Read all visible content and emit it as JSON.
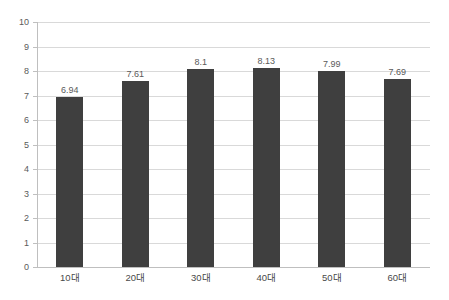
{
  "chart_data": {
    "type": "bar",
    "title": "",
    "subtitle": "",
    "xlabel": "",
    "ylabel": "",
    "categories": [
      "10대",
      "20대",
      "30대",
      "40대",
      "50대",
      "60대"
    ],
    "values": [
      6.94,
      7.61,
      8.1,
      8.13,
      7.99,
      7.69
    ],
    "value_labels": [
      "6.94",
      "7.61",
      "8.1",
      "8.13",
      "7.99",
      "7.69"
    ],
    "ylim": [
      0,
      10
    ],
    "ytick_values": [
      0,
      1,
      2,
      3,
      4,
      5,
      6,
      7,
      8,
      9,
      10
    ],
    "ytick_labels": [
      "0",
      "1",
      "2",
      "3",
      "4",
      "5",
      "6",
      "7",
      "8",
      "9",
      "10"
    ],
    "grid": true,
    "grid_axis": "y",
    "legend": false,
    "legend_position": "none",
    "series": [
      {
        "name": "",
        "values": [
          6.94,
          7.61,
          8.1,
          8.13,
          7.99,
          7.69
        ]
      }
    ],
    "colors": {
      "bar": "#3f3f3f",
      "gridline": "#d9d9d9",
      "axis": "#bfbfbf",
      "tick_text": "#5a5a5a",
      "value_text": "#5a5a5a",
      "category_text": "#4a4a4a",
      "background": "#ffffff"
    },
    "data_labels_shown": true
  }
}
